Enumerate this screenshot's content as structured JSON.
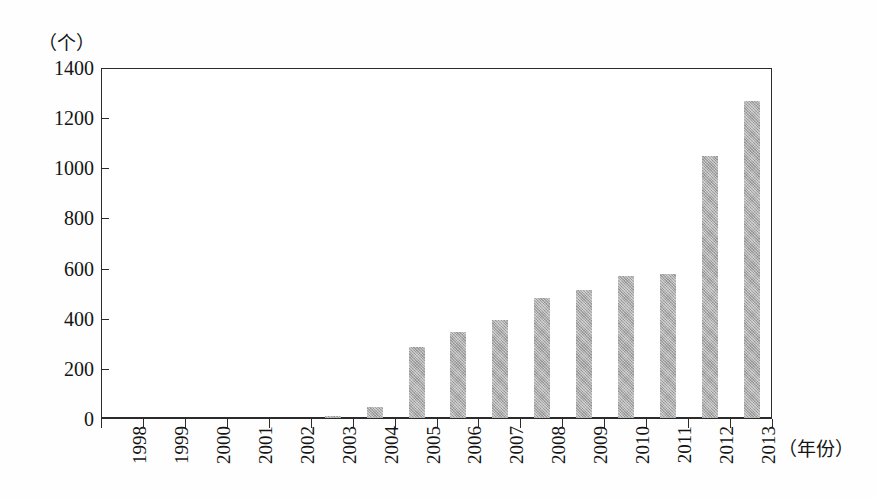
{
  "axis": {
    "y_unit_label": "（个）",
    "x_unit_label": "（年份）",
    "y_ticks": [
      "0",
      "200",
      "400",
      "600",
      "800",
      "1000",
      "1200",
      "1400"
    ]
  },
  "style": {
    "bar_color": "#a3a3a3",
    "axis_color": "#2b2b2b",
    "background": "#ffffff",
    "text_color": "#141414"
  },
  "chart_data": {
    "type": "bar",
    "title": "",
    "xlabel": "（年份）",
    "ylabel": "（个）",
    "ylim": [
      0,
      1400
    ],
    "ytick_step": 200,
    "grid": false,
    "legend": false,
    "categories": [
      "1998",
      "1999",
      "2000",
      "2001",
      "2002",
      "2003",
      "2004",
      "2005",
      "2006",
      "2007",
      "2008",
      "2009",
      "2010",
      "2011",
      "2012",
      "2013"
    ],
    "values": [
      0,
      0,
      0,
      0,
      0,
      10,
      45,
      283,
      343,
      391,
      479,
      511,
      566,
      574,
      1044,
      1263
    ]
  }
}
